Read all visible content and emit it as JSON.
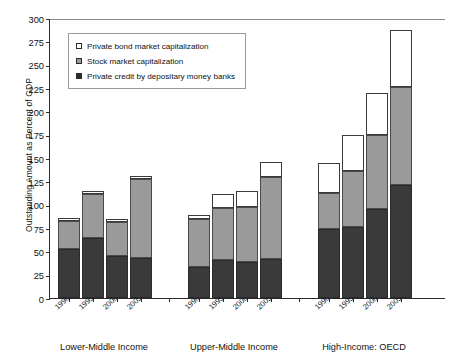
{
  "chart_data": {
    "type": "bar",
    "stacked": true,
    "title": "",
    "xlabel": "",
    "ylabel": "Outstanding Amount as Percent of GDP",
    "ylim": [
      0,
      300
    ],
    "ytick_step": 25,
    "yticks": [
      0,
      25,
      50,
      75,
      100,
      125,
      150,
      175,
      200,
      225,
      250,
      275,
      300
    ],
    "grid": false,
    "legend_position": "upper-left-inside",
    "categories": [
      "1990–94",
      "1995–99",
      "2000–04",
      "2005–09"
    ],
    "groups": [
      "Lower-Middle Income",
      "Upper-Middle Income",
      "High-Income: OECD"
    ],
    "series": [
      {
        "name": "Private credit by depositary money banks",
        "color": "#3a3a3a",
        "values": {
          "Lower-Middle Income": [
            52,
            64,
            45,
            43
          ],
          "Upper-Middle Income": [
            33,
            41,
            39,
            42
          ],
          "High-Income: OECD": [
            74,
            76,
            95,
            121
          ]
        }
      },
      {
        "name": "Stock market capitalization",
        "color": "#9a9a9a",
        "values": {
          "Lower-Middle Income": [
            30,
            47,
            36,
            85
          ],
          "Upper-Middle Income": [
            52,
            55,
            58,
            88
          ],
          "High-Income: OECD": [
            38,
            60,
            80,
            105
          ]
        }
      },
      {
        "name": "Private bond market capitalization",
        "color": "#ffffff",
        "values": {
          "Lower-Middle Income": [
            4,
            4,
            4,
            3
          ],
          "Upper-Middle Income": [
            4,
            15,
            18,
            16
          ],
          "High-Income: OECD": [
            33,
            39,
            45,
            61
          ]
        }
      }
    ],
    "totals": {
      "Lower-Middle Income": [
        86,
        115,
        85,
        131
      ],
      "Upper-Middle Income": [
        89,
        111,
        115,
        146
      ],
      "High-Income: OECD": [
        145,
        175,
        220,
        287
      ]
    }
  },
  "legend": {
    "items": [
      {
        "label": "Private bond market capitalization",
        "swatch": "bond"
      },
      {
        "label": "Stock market capitalization",
        "swatch": "stock"
      },
      {
        "label": "Private credit by depositary money banks",
        "swatch": "credit"
      }
    ]
  },
  "axis": {
    "y_title": "Outstanding Amount as Percent of GDP",
    "y_labels": [
      "300",
      "275",
      "250",
      "225",
      "200",
      "175",
      "150",
      "125",
      "100",
      "75",
      "50",
      "25",
      "0"
    ]
  },
  "colors": {
    "credit": "#3a3a3a",
    "stock": "#9a9a9a",
    "bond": "#ffffff",
    "axis": "#2b2b2b",
    "background": "#ffffff"
  }
}
